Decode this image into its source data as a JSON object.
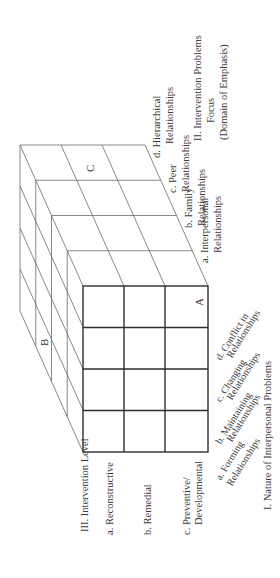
{
  "figure": {
    "axis_I": {
      "title": "I. Nature of Interpersonal Problems",
      "items": [
        {
          "line1": "a. Forming",
          "line2": "Relationships"
        },
        {
          "line1": "b. Maintaining",
          "line2": "Relationships"
        },
        {
          "line1": "c. Changing",
          "line2": "Relationships"
        },
        {
          "line1": "d. Conflict in",
          "line2": "Relationships"
        }
      ]
    },
    "axis_II": {
      "title_line1": "II. Intervention Problems",
      "title_line2": "Focus",
      "title_line3": "(Domain of Emphasis)",
      "items": [
        {
          "line1": "a. Interpersonal",
          "line2": "Relationships"
        },
        {
          "line1": "b. Family",
          "line2": "Relationships"
        },
        {
          "line1": "c. Peer",
          "line2": "Relationships"
        },
        {
          "line1": "d. Hierarchical",
          "line2": "Relationships"
        }
      ]
    },
    "axis_III": {
      "title": "III. Intervention Level",
      "items": [
        {
          "line1": "a. Reconstructive",
          "line2": ""
        },
        {
          "line1": "b. Remedial",
          "line2": ""
        },
        {
          "line1": "c. Preventive/",
          "line2": "Developmental"
        }
      ]
    },
    "cell_markers": {
      "A": "A",
      "B": "B",
      "C": "C"
    },
    "colors": {
      "line": "#3a3a3a",
      "thin_line": "#6a6a6a",
      "text": "#3a3a3a",
      "background": "#ffffff"
    }
  }
}
